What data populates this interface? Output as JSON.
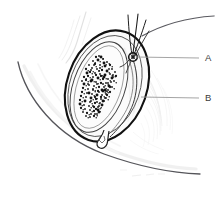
{
  "figure": {
    "background_color": "#ffffff",
    "width": 224,
    "height": 202,
    "style": "pen-and-ink line drawing with stipple shading"
  },
  "labels": [
    {
      "id": "A",
      "text": "A",
      "text_x": 205,
      "text_y": 61,
      "leader_from_x": 199,
      "leader_from_y": 58,
      "leader_to_x": 136,
      "leader_to_y": 57,
      "target": "appendix-testis-nodule"
    },
    {
      "id": "B",
      "text": "B",
      "text_x": 205,
      "text_y": 101,
      "leader_from_x": 199,
      "leader_from_y": 98,
      "leader_to_x": 141,
      "leader_to_y": 97,
      "target": "tunica-outer-capsule"
    }
  ],
  "colors": {
    "outline_dark": "#1a1a1a",
    "outline_medium": "#4a4a4a",
    "leader_line": "#9a9a9a",
    "label_text": "#3b3b3b",
    "faint_shading": "#d8d8d8",
    "very_faint_shading": "#ececec",
    "stipple": "#141414",
    "interior_fill": "#f7f7f7"
  },
  "structures": [
    {
      "name": "outer-capsule",
      "description": "heavy dark oval outline, tilted ~20 degrees"
    },
    {
      "name": "inner-capsule",
      "description": "thin oval inside outer capsule"
    },
    {
      "name": "parenchyma-oval",
      "description": "inner elongated oval with dense stipple"
    },
    {
      "name": "stipple-region",
      "description": "dense black dot texture, seminiferous tubules"
    },
    {
      "name": "appendix-nodule",
      "description": "small dark knot at upper right of oval"
    },
    {
      "name": "spermatic-cord-vessels",
      "description": "three thin lines fanning upward from nodule"
    },
    {
      "name": "sweeping-curve",
      "description": "long thin arc from cord to upper right edge"
    },
    {
      "name": "wavy-tail",
      "description": "small zigzag structure at lower pole of inner oval"
    },
    {
      "name": "body-contour-upper-left",
      "description": "faint wispy vertical curve upper left"
    },
    {
      "name": "body-contour-lower",
      "description": "long sweeping curve across lower left to lower right"
    },
    {
      "name": "hatch-shading-right",
      "description": "faint radiating hatch lines right of oval"
    }
  ],
  "stipple_dots": [
    [
      98,
      60
    ],
    [
      103,
      59
    ],
    [
      107,
      62
    ],
    [
      95,
      64
    ],
    [
      100,
      65
    ],
    [
      105,
      66
    ],
    [
      110,
      65
    ],
    [
      92,
      68
    ],
    [
      97,
      69
    ],
    [
      102,
      70
    ],
    [
      107,
      71
    ],
    [
      112,
      69
    ],
    [
      90,
      72
    ],
    [
      95,
      73
    ],
    [
      100,
      74
    ],
    [
      105,
      75
    ],
    [
      110,
      74
    ],
    [
      115,
      72
    ],
    [
      88,
      76
    ],
    [
      93,
      77
    ],
    [
      98,
      78
    ],
    [
      103,
      79
    ],
    [
      108,
      79
    ],
    [
      113,
      77
    ],
    [
      86,
      80
    ],
    [
      91,
      81
    ],
    [
      96,
      82
    ],
    [
      101,
      83
    ],
    [
      106,
      83
    ],
    [
      111,
      82
    ],
    [
      84,
      84
    ],
    [
      89,
      85
    ],
    [
      94,
      86
    ],
    [
      99,
      87
    ],
    [
      104,
      87
    ],
    [
      109,
      86
    ],
    [
      83,
      88
    ],
    [
      88,
      89
    ],
    [
      93,
      90
    ],
    [
      98,
      91
    ],
    [
      103,
      91
    ],
    [
      108,
      90
    ],
    [
      82,
      92
    ],
    [
      87,
      93
    ],
    [
      92,
      94
    ],
    [
      97,
      95
    ],
    [
      102,
      95
    ],
    [
      106,
      94
    ],
    [
      81,
      96
    ],
    [
      86,
      97
    ],
    [
      91,
      98
    ],
    [
      96,
      99
    ],
    [
      101,
      99
    ],
    [
      105,
      98
    ],
    [
      80,
      100
    ],
    [
      85,
      101
    ],
    [
      90,
      102
    ],
    [
      95,
      103
    ],
    [
      100,
      103
    ],
    [
      104,
      101
    ],
    [
      80,
      104
    ],
    [
      84,
      105
    ],
    [
      89,
      106
    ],
    [
      94,
      107
    ],
    [
      98,
      107
    ],
    [
      102,
      105
    ],
    [
      81,
      108
    ],
    [
      85,
      109
    ],
    [
      90,
      110
    ],
    [
      94,
      111
    ],
    [
      98,
      110
    ],
    [
      83,
      112
    ],
    [
      87,
      113
    ],
    [
      91,
      114
    ],
    [
      95,
      114
    ],
    [
      99,
      112
    ],
    [
      86,
      116
    ],
    [
      90,
      117
    ],
    [
      94,
      116
    ],
    [
      97,
      114
    ],
    [
      101,
      57
    ],
    [
      96,
      57
    ],
    [
      93,
      61
    ],
    [
      89,
      65
    ],
    [
      86,
      69
    ],
    [
      112,
      78
    ],
    [
      114,
      81
    ],
    [
      110,
      92
    ],
    [
      106,
      98
    ],
    [
      99,
      56
    ],
    [
      104,
      63
    ],
    [
      109,
      69
    ],
    [
      113,
      75
    ],
    [
      116,
      76
    ],
    [
      91,
      70
    ],
    [
      87,
      73
    ],
    [
      84,
      77
    ],
    [
      82,
      81
    ],
    [
      100,
      68
    ],
    [
      96,
      75
    ],
    [
      92,
      80
    ],
    [
      88,
      84
    ],
    [
      101,
      76
    ],
    [
      97,
      84
    ],
    [
      93,
      89
    ],
    [
      89,
      93
    ],
    [
      103,
      84
    ],
    [
      99,
      92
    ],
    [
      95,
      97
    ],
    [
      91,
      101
    ],
    [
      105,
      90
    ],
    [
      101,
      97
    ],
    [
      97,
      102
    ],
    [
      93,
      106
    ],
    [
      107,
      95
    ],
    [
      103,
      101
    ],
    [
      99,
      106
    ],
    [
      96,
      109
    ],
    [
      94,
      65
    ],
    [
      99,
      71
    ],
    [
      104,
      77
    ],
    [
      108,
      83
    ],
    [
      112,
      87
    ],
    [
      110,
      87
    ],
    [
      106,
      91
    ],
    [
      102,
      90
    ]
  ]
}
